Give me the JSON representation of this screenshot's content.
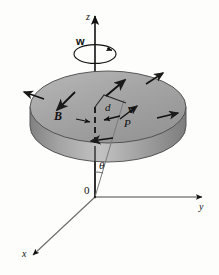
{
  "figure": {
    "type": "physics-diagram-3d",
    "background_color": "#fdfdfc",
    "ink_color": "#111111",
    "disk_top_color": "#a9a9a9",
    "disk_rim_color": "#8e8e8e",
    "disk_highlight_color": "#c9c9c9"
  },
  "labels": {
    "z_axis": "z",
    "y_axis": "y",
    "x_axis": "x",
    "origin": "0",
    "angular_velocity": "w",
    "magnetic_field": "B",
    "distance": "d",
    "velocity": "v",
    "point": "P",
    "angle": "θ"
  },
  "elements": {
    "z_axis_name": "vertical rotation axis",
    "y_axis_name": "horizontal axis to the right",
    "x_axis_name": "axis toward lower left",
    "rotation_arrow_name": "circular spin arrow about z",
    "disk_name": "shaded rotating disk",
    "radius_line_name": "dashed radius d from axis to P",
    "ray_name": "line from origin to P",
    "tangent_arrows_count": "5",
    "field_arrows_count": "3"
  },
  "geometry": {
    "disk_center_x": "108",
    "disk_center_y": "107",
    "disk_rx": "78",
    "disk_ry": "36",
    "disk_thickness": "26",
    "origin_x": "95",
    "origin_y": "197",
    "z_top_y": "12",
    "y_end_x": "206",
    "x_end_x": "30",
    "x_end_y": "258"
  }
}
